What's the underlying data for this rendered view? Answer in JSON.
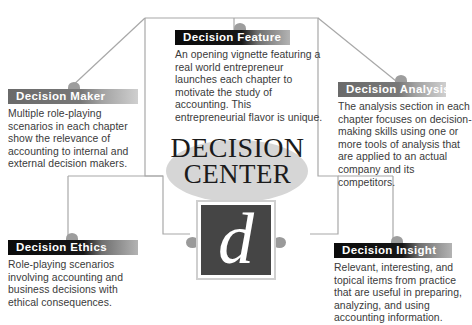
{
  "diagram": {
    "type": "hub-and-spoke",
    "hub": {
      "wordmark_line1": "DECISION",
      "wordmark_line2": "CENTER",
      "logo_letter": "d"
    },
    "colors": {
      "header_dark": "#0b0b0b",
      "header_grey": "#6a6a6a",
      "nub": "#9d9d9d",
      "connector_line": "#a8a8a8",
      "hub_ellipse": "#d6d6d6",
      "logo_background": "#454545",
      "body_text": "#3a3a3a",
      "header_text": "#ffffff",
      "page_background": "#ffffff"
    },
    "panels": [
      {
        "id": "feature",
        "title": "Decision Feature",
        "body": "An opening vignette featuring a real world entrepreneur launches each chapter to motivate the study of accounting. This entrepreneurial flavor is unique.",
        "header_style": "dark",
        "position": "top-center"
      },
      {
        "id": "maker",
        "title": "Decision Maker",
        "body": "Multiple role-playing scenarios in each chapter show the relevance of accounting to internal and external decision makers.",
        "header_style": "grey",
        "position": "left-upper"
      },
      {
        "id": "analysis",
        "title": "Decision Analysis",
        "body": "The analysis section in each chapter focuses on decision-making skills using one or more tools of analysis that are applied to an actual company and its competitors.",
        "header_style": "grey",
        "position": "right-upper"
      },
      {
        "id": "ethics",
        "title": "Decision Ethics",
        "body": "Role-playing scenarios involving accounting and business decisions with ethical consequences.",
        "header_style": "dark",
        "position": "left-lower"
      },
      {
        "id": "insight",
        "title": "Decision Insight",
        "body": "Relevant, interesting, and topical items from practice that are useful in preparing, analyzing, and using accounting information.",
        "header_style": "dark",
        "position": "right-lower"
      }
    ]
  }
}
